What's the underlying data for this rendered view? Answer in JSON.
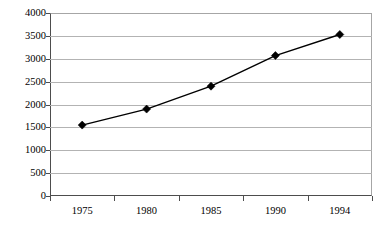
{
  "chart_data": {
    "type": "line",
    "title": "",
    "subtitle": "",
    "xlabel": "",
    "ylabel": "",
    "categories": [
      "1975",
      "1980",
      "1985",
      "1990",
      "1994"
    ],
    "values": [
      1550,
      1900,
      2400,
      3070,
      3530
    ],
    "series": [
      {
        "name": "",
        "values": [
          1550,
          1900,
          2400,
          3070,
          3530
        ]
      }
    ],
    "ylim": [
      0,
      4000
    ],
    "y_ticks": [
      0,
      500,
      1000,
      1500,
      2000,
      2500,
      3000,
      3500,
      4000
    ],
    "y_tick_labels": [
      "0",
      "500",
      "1000",
      "1500",
      "2000",
      "2500",
      "3000",
      "3500",
      "4000"
    ],
    "x_tick_labels": [
      "1975",
      "1980",
      "1985",
      "1990",
      "1994"
    ],
    "grid": true,
    "grid_axis": "y",
    "legend": false,
    "legend_position": "none",
    "annotations": [],
    "marker": "diamond",
    "colors": {
      "line": "#000000",
      "marker": "#000000",
      "gridline": "#b3b3b3",
      "axis": "#4d4d4d",
      "plot_background": "#ffffff",
      "text": "#000000"
    }
  }
}
